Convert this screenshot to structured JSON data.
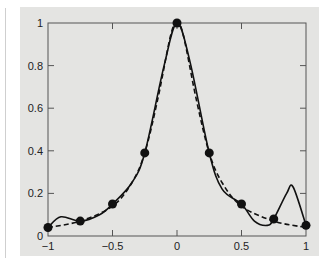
{
  "chart_data": {
    "type": "line",
    "title": "",
    "xlabel": "",
    "ylabel": "",
    "xlim": [
      -1,
      1
    ],
    "ylim": [
      0,
      1
    ],
    "grid": false,
    "legend": null,
    "x_ticks": [
      "-1",
      "-0.5",
      "0",
      "0.5",
      "1"
    ],
    "y_ticks": [
      "0",
      "0.2",
      "0.4",
      "0.6",
      "0.8",
      "1"
    ],
    "series": [
      {
        "name": "data points",
        "style": "markers",
        "x": [
          -1,
          -0.75,
          -0.5,
          -0.25,
          0,
          0.25,
          0.5,
          0.75,
          1
        ],
        "y": [
          0.04,
          0.07,
          0.15,
          0.39,
          1.0,
          0.39,
          0.15,
          0.08,
          0.05
        ]
      },
      {
        "name": "interpolating curve",
        "style": "solid",
        "x": [
          -1,
          -0.9,
          -0.75,
          -0.6,
          -0.5,
          -0.35,
          -0.25,
          -0.1,
          0,
          0.1,
          0.25,
          0.35,
          0.5,
          0.6,
          0.7,
          0.75,
          0.85,
          0.9,
          1
        ],
        "y": [
          0.04,
          0.09,
          0.07,
          0.1,
          0.15,
          0.25,
          0.39,
          0.8,
          1.0,
          0.82,
          0.39,
          0.22,
          0.15,
          0.07,
          0.05,
          0.08,
          0.2,
          0.23,
          0.05
        ]
      },
      {
        "name": "reference function",
        "style": "dashed",
        "x": [
          -1,
          -0.75,
          -0.5,
          -0.35,
          -0.25,
          -0.15,
          -0.05,
          0,
          0.05,
          0.15,
          0.25,
          0.35,
          0.5,
          0.75,
          1
        ],
        "y": [
          0.04,
          0.07,
          0.14,
          0.25,
          0.39,
          0.64,
          0.94,
          1.0,
          0.94,
          0.64,
          0.39,
          0.25,
          0.14,
          0.07,
          0.04
        ]
      }
    ]
  }
}
